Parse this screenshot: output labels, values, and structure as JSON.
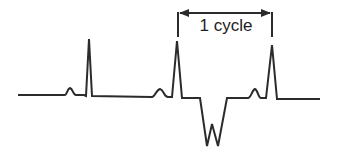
{
  "diagram": {
    "type": "ecg-waveform",
    "annotation": {
      "label": "1 cycle",
      "spans": "from second R peak to third R peak"
    },
    "complexes": [
      {
        "name": "beat-1",
        "p_wave": true,
        "qrs": "upright R spike"
      },
      {
        "name": "beat-2",
        "p_wave": true,
        "qrs": "upright R spike"
      },
      {
        "name": "ectopic-beat",
        "p_wave": false,
        "qrs": "inverted W-shaped deflection"
      },
      {
        "name": "beat-3",
        "p_wave": true,
        "qrs": "upright R spike"
      }
    ],
    "colors": {
      "stroke": "#2b2b2b",
      "background": "#ffffff"
    }
  }
}
